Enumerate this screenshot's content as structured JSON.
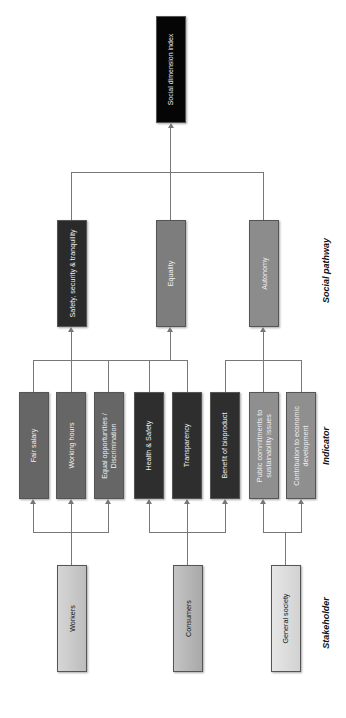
{
  "diagram": {
    "top": {
      "label": "Social dimension index",
      "color": "#050505"
    },
    "levels": {
      "pathway": "Social pathway",
      "indicator": "Indicator",
      "stakeholder": "Stakeholder"
    },
    "pathways": [
      {
        "label": "Safety, security & tranquility",
        "color": "#2a2a2a"
      },
      {
        "label": "Equality",
        "color": "#7d7d7d"
      },
      {
        "label": "Autonomy",
        "color": "#8c8c8c"
      }
    ],
    "indicators": [
      {
        "label": "Fair salary",
        "color": "#666666",
        "stakeholder": "Workers",
        "pathway": "Equality"
      },
      {
        "label": "Working hours",
        "color": "#666666",
        "stakeholder": "Workers",
        "pathway": "Safety, security & tranquility"
      },
      {
        "label": "Equal opportunities / Discrimination",
        "line1": "Equal opportunities /",
        "line2": "Discrimination",
        "color": "#666666",
        "stakeholder": "Workers",
        "pathway": "Equality"
      },
      {
        "label": "Health & Safety",
        "color": "#2e2e2e",
        "stakeholder": "Consumers",
        "pathway": "Equality"
      },
      {
        "label": "Transparency",
        "color": "#2e2e2e",
        "stakeholder": "Consumers",
        "pathway": "Equality"
      },
      {
        "label": "Benefit of bioproduct",
        "color": "#2e2e2e",
        "stakeholder": "Consumers",
        "pathway": "Autonomy"
      },
      {
        "label": "Public commitments to sustainability issues",
        "line1": "Public commitments to",
        "line2": "sustainability issues",
        "color": "#8f8f8f",
        "stakeholder": "General society",
        "pathway": "Autonomy"
      },
      {
        "label": "Contribution to economic development",
        "line1": "Contribution to economic",
        "line2": "development",
        "color": "#8f8f8f",
        "stakeholder": "General society",
        "pathway": "Autonomy"
      }
    ],
    "stakeholders": [
      {
        "label": "Workers",
        "color": "#c9c9c9"
      },
      {
        "label": "Consumers",
        "color": "#b5b5b5"
      },
      {
        "label": "General society",
        "color": "#dcdcdc"
      }
    ]
  }
}
